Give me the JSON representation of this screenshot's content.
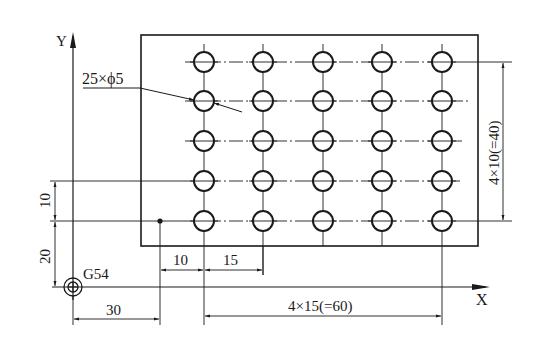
{
  "drawing": {
    "description": "Hole pattern drawing: 5x5 grid of holes on rectangular plate with G54 work coordinate origin",
    "axes": {
      "x_label": "X",
      "y_label": "Y"
    },
    "origin_label": "G54",
    "callout_holes": "25×ϕ5",
    "dimensions": {
      "origin_to_ref_x": "30",
      "ref_to_first_hole_x": "10",
      "hole_pitch_x": "15",
      "total_pitch_x": "4×15(=60)",
      "origin_to_ref_y": "20",
      "ref_to_row_y": "10",
      "total_pitch_y": "4×10(=40)"
    },
    "grid": {
      "columns": 5,
      "rows": 5,
      "hole_count": 25,
      "hole_diameter": "ϕ5"
    },
    "colors": {
      "line": "#1a1a1a",
      "background": "#ffffff"
    }
  }
}
